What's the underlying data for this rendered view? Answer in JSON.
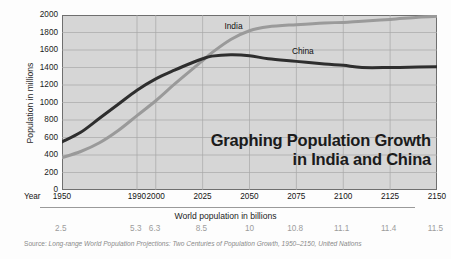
{
  "title": {
    "line1": "Graphing Population Growth",
    "line2": "in India and China"
  },
  "axes": {
    "y_title": "Population in millions",
    "year_word": "Year",
    "world_pop_title": "World population in billions"
  },
  "source": {
    "lead": "Source: ",
    "text": "Long-range World Population Projections: Two Centuries of Population Growth, 1950–2150, United Nations"
  },
  "colors": {
    "china_line": "#2e2e2e",
    "india_line": "#9a9a9a",
    "plot_bg": "#d6d6d6",
    "grid": "#a8a8a8",
    "frame": "#6f6f6f",
    "billions_text": "#9c9c9c"
  },
  "chart_data": {
    "type": "line",
    "title": "Graphing Population Growth in India and China",
    "xlabel": "Year",
    "ylabel": "Population in millions",
    "ylim": [
      0,
      2000
    ],
    "xlim": [
      1950,
      2150
    ],
    "grid": true,
    "legend": "inline-annotation",
    "ytick_labels": [
      "0",
      "200",
      "400",
      "600",
      "800",
      "1000",
      "1200",
      "1400",
      "1600",
      "1800",
      "2000"
    ],
    "ytick_values": [
      0,
      200,
      400,
      600,
      800,
      1000,
      1200,
      1400,
      1600,
      1800,
      2000
    ],
    "xtick_labels": [
      "1950",
      "1990",
      "2000",
      "2025",
      "2050",
      "2075",
      "2100",
      "2125",
      "2150"
    ],
    "xtick_values": [
      1950,
      1990,
      2000,
      2025,
      2050,
      2075,
      2100,
      2125,
      2150
    ],
    "secondary_axis": {
      "label": "World population in billions",
      "tick_labels": [
        "2.5",
        "5.3",
        "6.3",
        "8.5",
        "10",
        "10.8",
        "11.1",
        "11.4",
        "11.5"
      ],
      "tick_values": [
        2.5,
        5.3,
        6.3,
        8.5,
        10,
        10.8,
        11.1,
        11.4,
        11.5
      ],
      "at_years": [
        1950,
        1990,
        2000,
        2025,
        2050,
        2075,
        2100,
        2125,
        2150
      ]
    },
    "x": [
      1950,
      1960,
      1970,
      1980,
      1990,
      2000,
      2010,
      2020,
      2025,
      2030,
      2040,
      2050,
      2060,
      2075,
      2090,
      2100,
      2110,
      2125,
      2140,
      2150
    ],
    "series": [
      {
        "name": "China",
        "color": "#2e2e2e",
        "label_year": 2079,
        "label_value": 1590,
        "values": [
          550,
          660,
          820,
          980,
          1140,
          1270,
          1370,
          1460,
          1500,
          1530,
          1545,
          1535,
          1500,
          1470,
          1440,
          1425,
          1400,
          1400,
          1405,
          1408
        ]
      },
      {
        "name": "India",
        "color": "#9a9a9a",
        "label_year": 2043,
        "label_value": 1875,
        "values": [
          370,
          440,
          540,
          680,
          850,
          1020,
          1210,
          1390,
          1480,
          1570,
          1720,
          1820,
          1865,
          1890,
          1910,
          1915,
          1930,
          1950,
          1975,
          1985
        ]
      }
    ]
  }
}
